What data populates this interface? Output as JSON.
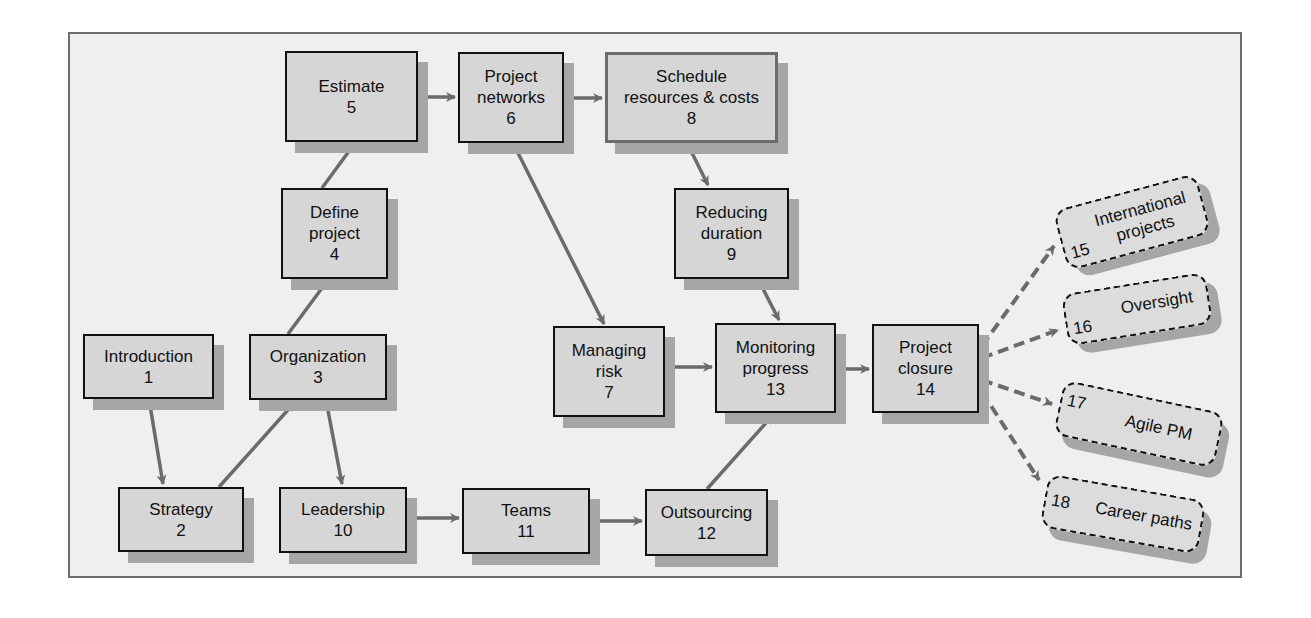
{
  "diagram": {
    "type": "flowchart",
    "colors": {
      "frame_bg": "#efefef",
      "frame_border": "#6e6e6e",
      "box_fill": "#d6d6d6",
      "box_shadow": "#a6a6a6",
      "arrow": "#6b6b6b"
    },
    "nodes": [
      {
        "id": 1,
        "label": "Introduction",
        "number": "1"
      },
      {
        "id": 2,
        "label": "Strategy",
        "number": "2"
      },
      {
        "id": 3,
        "label": "Organization",
        "number": "3"
      },
      {
        "id": 4,
        "label_lines": [
          "Define",
          "project"
        ],
        "number": "4"
      },
      {
        "id": 5,
        "label": "Estimate",
        "number": "5"
      },
      {
        "id": 6,
        "label_lines": [
          "Project",
          "networks"
        ],
        "number": "6"
      },
      {
        "id": 7,
        "label_lines": [
          "Managing",
          "risk"
        ],
        "number": "7"
      },
      {
        "id": 8,
        "label_lines": [
          "Schedule",
          "resources & costs"
        ],
        "number": "8"
      },
      {
        "id": 9,
        "label_lines": [
          "Reducing",
          "duration"
        ],
        "number": "9"
      },
      {
        "id": 10,
        "label": "Leadership",
        "number": "10"
      },
      {
        "id": 11,
        "label": "Teams",
        "number": "11"
      },
      {
        "id": 12,
        "label": "Outsourcing",
        "number": "12"
      },
      {
        "id": 13,
        "label_lines": [
          "Monitoring",
          "progress"
        ],
        "number": "13"
      },
      {
        "id": 14,
        "label_lines": [
          "Project",
          "closure"
        ],
        "number": "14"
      }
    ],
    "optional_nodes": [
      {
        "id": 15,
        "label_lines": [
          "International",
          "projects"
        ],
        "number": "15"
      },
      {
        "id": 16,
        "label": "Oversight",
        "number": "16"
      },
      {
        "id": 17,
        "label": "Agile PM",
        "number": "17"
      },
      {
        "id": 18,
        "label": "Career paths",
        "number": "18"
      }
    ],
    "edges": [
      {
        "from": 1,
        "to": 2,
        "style": "solid"
      },
      {
        "from": 2,
        "to": 3,
        "style": "solid"
      },
      {
        "from": 3,
        "to": 4,
        "style": "solid"
      },
      {
        "from": 3,
        "to": 10,
        "style": "solid"
      },
      {
        "from": 4,
        "to": 5,
        "style": "solid"
      },
      {
        "from": 5,
        "to": 6,
        "style": "solid"
      },
      {
        "from": 6,
        "to": 8,
        "style": "solid"
      },
      {
        "from": 6,
        "to": 7,
        "style": "solid"
      },
      {
        "from": 8,
        "to": 9,
        "style": "solid"
      },
      {
        "from": 9,
        "to": 13,
        "style": "solid"
      },
      {
        "from": 7,
        "to": 13,
        "style": "solid"
      },
      {
        "from": 10,
        "to": 11,
        "style": "solid"
      },
      {
        "from": 11,
        "to": 12,
        "style": "solid"
      },
      {
        "from": 12,
        "to": 13,
        "style": "solid"
      },
      {
        "from": 13,
        "to": 14,
        "style": "solid"
      },
      {
        "from": 14,
        "to": 15,
        "style": "dashed"
      },
      {
        "from": 14,
        "to": 16,
        "style": "dashed"
      },
      {
        "from": 14,
        "to": 17,
        "style": "dashed"
      },
      {
        "from": 14,
        "to": 18,
        "style": "dashed"
      }
    ]
  }
}
